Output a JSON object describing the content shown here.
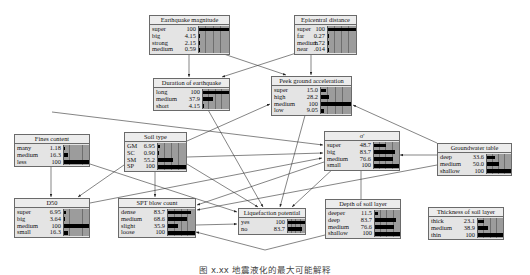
{
  "diagram": {
    "type": "bayesian-network",
    "nodes": [
      {
        "id": "earthquake_magnitude",
        "title": "Earthquake magnitude",
        "x": 149,
        "y": 15,
        "w": 81,
        "states": [
          {
            "label": "super",
            "value": "100",
            "pct": 100
          },
          {
            "label": "big",
            "value": "4.15",
            "pct": 4.15
          },
          {
            "label": "strong",
            "value": "2.15",
            "pct": 2.15
          },
          {
            "label": "medium",
            "value": "0.59",
            "pct": 0.59
          }
        ]
      },
      {
        "id": "epicentral_distance",
        "title": "Epicentral distance",
        "x": 294,
        "y": 15,
        "w": 63,
        "states": [
          {
            "label": "super",
            "value": "100",
            "pct": 100
          },
          {
            "label": "far",
            "value": "0.27",
            "pct": 0.27
          },
          {
            "label": "medium",
            "value": "1.72",
            "pct": 1.72
          },
          {
            "label": "near",
            "value": ".014",
            "pct": 0.014
          }
        ]
      },
      {
        "id": "duration_of_earthquake",
        "title": "Duration of earthquake",
        "x": 153,
        "y": 78,
        "w": 77,
        "states": [
          {
            "label": "long",
            "value": "100",
            "pct": 100
          },
          {
            "label": "medium",
            "value": "37.9",
            "pct": 37.9
          },
          {
            "label": "short",
            "value": "4.15",
            "pct": 4.15
          }
        ]
      },
      {
        "id": "peak_ground_acceleration",
        "title": "Peek ground acceleration",
        "x": 271,
        "y": 76,
        "w": 81,
        "states": [
          {
            "label": "super",
            "value": "15.0",
            "pct": 15.0
          },
          {
            "label": "high",
            "value": "28.2",
            "pct": 28.2
          },
          {
            "label": "medium",
            "value": "100",
            "pct": 100
          },
          {
            "label": "low",
            "value": "9.05",
            "pct": 9.05
          }
        ]
      },
      {
        "id": "fines_content",
        "title": "Fines content",
        "x": 14,
        "y": 134,
        "w": 76,
        "states": [
          {
            "label": "many",
            "value": "1.18",
            "pct": 1.18
          },
          {
            "label": "medium",
            "value": "16.3",
            "pct": 16.3
          },
          {
            "label": "less",
            "value": "100",
            "pct": 100
          }
        ]
      },
      {
        "id": "soil_type",
        "title": "Soil type",
        "x": 124,
        "y": 132,
        "w": 63,
        "states": [
          {
            "label": "GM",
            "value": "6.95",
            "pct": 6.95
          },
          {
            "label": "SC",
            "value": "0.90",
            "pct": 0.9
          },
          {
            "label": "SM",
            "value": "55.2",
            "pct": 55.2
          },
          {
            "label": "SP",
            "value": "100",
            "pct": 100
          }
        ]
      },
      {
        "id": "sigma_prime",
        "title": "σ'",
        "x": 324,
        "y": 131,
        "w": 76,
        "states": [
          {
            "label": "super",
            "value": "48.7",
            "pct": 48.7
          },
          {
            "label": "big",
            "value": "83.7",
            "pct": 83.7
          },
          {
            "label": "medium",
            "value": "76.6",
            "pct": 76.6
          },
          {
            "label": "small",
            "value": "100",
            "pct": 100
          }
        ]
      },
      {
        "id": "groundwater_table",
        "title": "Groundwater table",
        "x": 437,
        "y": 143,
        "w": 75,
        "states": [
          {
            "label": "deep",
            "value": "33.6",
            "pct": 33.6
          },
          {
            "label": "medium",
            "value": "50.0",
            "pct": 50.0
          },
          {
            "label": "shallow",
            "value": "100",
            "pct": 100
          }
        ]
      },
      {
        "id": "d50",
        "title": "D50",
        "x": 14,
        "y": 198,
        "w": 76,
        "states": [
          {
            "label": "super",
            "value": "6.95",
            "pct": 6.95
          },
          {
            "label": "big",
            "value": "3.64",
            "pct": 3.64
          },
          {
            "label": "medium",
            "value": "100",
            "pct": 100
          },
          {
            "label": "small",
            "value": "16.3",
            "pct": 16.3
          }
        ]
      },
      {
        "id": "spt_blow_count",
        "title": "SPT blow count",
        "x": 118,
        "y": 198,
        "w": 78,
        "states": [
          {
            "label": "dense",
            "value": "83.7",
            "pct": 83.7
          },
          {
            "label": "medium",
            "value": "68.6",
            "pct": 68.6
          },
          {
            "label": "slight",
            "value": "35.9",
            "pct": 35.9
          },
          {
            "label": "loose",
            "value": "100",
            "pct": 100
          }
        ]
      },
      {
        "id": "liquefaction_potential",
        "title": "Liquefaction potential",
        "x": 238,
        "y": 208,
        "w": 68,
        "states": [
          {
            "label": "yes",
            "value": "100",
            "pct": 100
          },
          {
            "label": "no",
            "value": "83.7",
            "pct": 83.7
          }
        ]
      },
      {
        "id": "depth_of_soil_layer",
        "title": "Depth of soil layer",
        "x": 325,
        "y": 199,
        "w": 76,
        "states": [
          {
            "label": "deeper",
            "value": "11.5",
            "pct": 11.5
          },
          {
            "label": "deep",
            "value": "83.7",
            "pct": 83.7
          },
          {
            "label": "medium",
            "value": "76.6",
            "pct": 76.6
          },
          {
            "label": "shallow",
            "value": "100",
            "pct": 100
          }
        ]
      },
      {
        "id": "thickness_of_soil_layer",
        "title": "Thickness of soil layer",
        "x": 428,
        "y": 207,
        "w": 76,
        "states": [
          {
            "label": "thick",
            "value": "23.1",
            "pct": 23.1
          },
          {
            "label": "medium",
            "value": "38.9",
            "pct": 38.9
          },
          {
            "label": "thin",
            "value": "100",
            "pct": 100
          }
        ]
      }
    ],
    "edges": [
      [
        "earthquake_magnitude",
        "duration_of_earthquake"
      ],
      [
        "earthquake_magnitude",
        "peak_ground_acceleration"
      ],
      [
        "epicentral_distance",
        "duration_of_earthquake"
      ],
      [
        "epicentral_distance",
        "peak_ground_acceleration"
      ],
      [
        "fines_content",
        "d50"
      ],
      [
        "fines_content",
        "sigma_prime"
      ],
      [
        "fines_content",
        "liquefaction_potential"
      ],
      [
        "soil_type",
        "peak_ground_acceleration"
      ],
      [
        "soil_type",
        "spt_blow_count"
      ],
      [
        "soil_type",
        "d50"
      ],
      [
        "soil_type",
        "sigma_prime"
      ],
      [
        "soil_type",
        "liquefaction_potential"
      ],
      [
        "duration_of_earthquake",
        "liquefaction_potential"
      ],
      [
        "peak_ground_acceleration",
        "liquefaction_potential"
      ],
      [
        "groundwater_table",
        "peak_ground_acceleration"
      ],
      [
        "groundwater_table",
        "sigma_prime"
      ],
      [
        "groundwater_table",
        "spt_blow_count"
      ],
      [
        "sigma_prime",
        "spt_blow_count"
      ],
      [
        "sigma_prime",
        "liquefaction_potential"
      ],
      [
        "depth_of_soil_layer",
        "sigma_prime"
      ],
      [
        "d50",
        "liquefaction_potential"
      ],
      [
        "spt_blow_count",
        "liquefaction_potential"
      ],
      [
        "depth_of_soil_layer",
        "spt_blow_count"
      ]
    ]
  },
  "caption": "图 x.xx  地震液化的最大可能解释",
  "colors": {
    "node_bg": "#e4e4e4",
    "bar_bg": "#9c9c9c",
    "bar": "#000000",
    "border": "#6a6a6a"
  }
}
